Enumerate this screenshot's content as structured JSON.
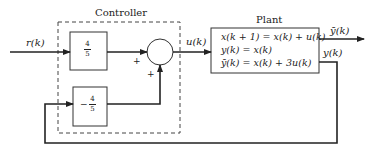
{
  "diagram": {
    "controller": {
      "title": "Controller",
      "forward_gain": {
        "numerator": "4",
        "denominator": "5"
      },
      "feedback_gain": {
        "sign": "−",
        "numerator": "4",
        "denominator": "5"
      },
      "summing_junction": {
        "input_sign_left": "+",
        "input_sign_bottom": "+"
      }
    },
    "plant": {
      "title": "Plant",
      "equations": [
        "x(k + 1) = x(k) + u(k)",
        "y(k) = x(k)",
        "ȳ(k) = x(k) + 3u(k)"
      ]
    },
    "signals": {
      "reference": "r(k)",
      "control": "u(k)",
      "output_bar": "ȳ(k)",
      "output": "y(k)"
    },
    "colors": {
      "line": "#222222",
      "background": "#ffffff"
    }
  }
}
